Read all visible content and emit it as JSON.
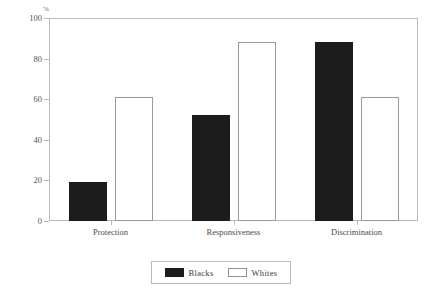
{
  "chart_data": {
    "type": "bar",
    "title": "",
    "subtitle": "",
    "xlabel": "",
    "ylabel": "%",
    "categories": [
      "Protection",
      "Responsiveness",
      "Discrimination"
    ],
    "series": [
      {
        "name": "Blacks",
        "values": [
          19,
          52,
          88
        ],
        "color": "#1c1c1c",
        "fill": "solid"
      },
      {
        "name": "Whites",
        "values": [
          61,
          88,
          61
        ],
        "color": "#ffffff",
        "fill": "outline"
      }
    ],
    "ylim": [
      0,
      100
    ],
    "yticks": [
      0,
      20,
      40,
      60,
      80,
      100
    ],
    "ytick_labels": [
      "0",
      "20",
      "40",
      "60",
      "80",
      "100"
    ],
    "grid": false,
    "legend_position": "bottom-center",
    "legend_entries": [
      "Blacks",
      "Whites"
    ]
  },
  "axis": {
    "y_unit_label": "%"
  },
  "legend": {
    "blacks_label": "Blacks",
    "whites_label": "Whites"
  }
}
